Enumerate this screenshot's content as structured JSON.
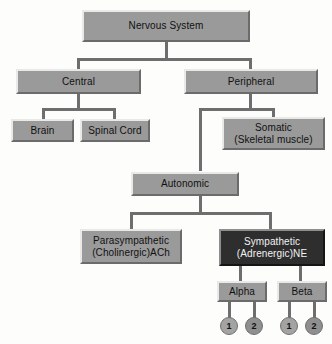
{
  "diagram": {
    "type": "hierarchy-tree",
    "colors": {
      "box_fill": "#9a9a9a",
      "box_fill_dark": "#2e2e2e",
      "box_highlight": "#e9e9e7",
      "box_shadow": "#6b6b6b",
      "connector": "#6e6e6e",
      "circle_fill": "#a3a3a3",
      "circle_fill_alt": "#8f8f8f",
      "background": "#fdfdfc",
      "text": "#111111",
      "text_inverse": "#f2f2f2"
    },
    "nodes": {
      "root": {
        "label": "Nervous System"
      },
      "central": {
        "label": "Central"
      },
      "peripheral": {
        "label": "Peripheral"
      },
      "brain": {
        "label": "Brain"
      },
      "spinal_cord": {
        "label": "Spinal Cord"
      },
      "somatic": {
        "line1": "Somatic",
        "line2": "(Skeletal muscle)"
      },
      "autonomic": {
        "label": "Autonomic"
      },
      "parasympathetic": {
        "line1": "Parasympathetic",
        "line2": "(Cholinergic)ACh"
      },
      "sympathetic": {
        "line1": "Sympathetic",
        "line2": "(Adrenergic)NE"
      },
      "alpha": {
        "label": "Alpha"
      },
      "beta": {
        "label": "Beta"
      },
      "alpha_1": {
        "label": "1"
      },
      "alpha_2": {
        "label": "2"
      },
      "beta_1": {
        "label": "1"
      },
      "beta_2": {
        "label": "2"
      }
    }
  }
}
